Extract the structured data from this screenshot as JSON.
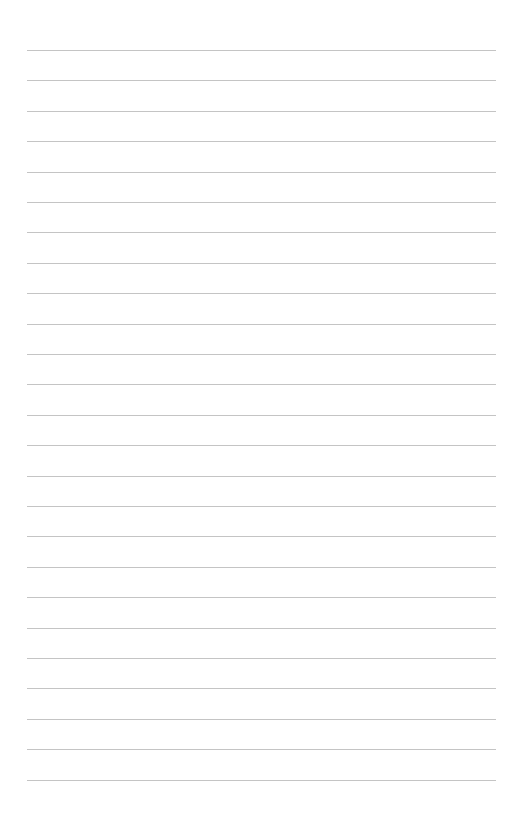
{
  "page": {
    "type": "lined-paper",
    "background": "#ffffff",
    "rule_color": "#c4c4c4",
    "rule_count": 25,
    "first_rule_y": 50,
    "rule_spacing": 30.4,
    "rule_left": 27,
    "rule_right": 496
  }
}
